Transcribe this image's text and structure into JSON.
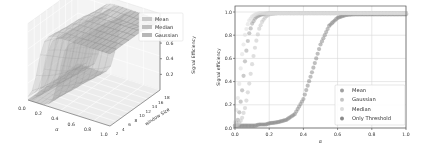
{
  "chart_data": [
    {
      "type": "surface3d",
      "title": "",
      "xlabel": "α",
      "ylabel": "window Size",
      "zlabel": "Signal Efficiency",
      "x_ticks": [
        "0.0",
        "0.2",
        "0.4",
        "0.6",
        "0.8",
        "1.0"
      ],
      "y_ticks": [
        "2",
        "4",
        "6",
        "8",
        "10",
        "12",
        "14",
        "16",
        "18"
      ],
      "z_ticks": [
        "0.2",
        "0.4",
        "0.6",
        "0.8"
      ],
      "xlim": [
        0,
        1
      ],
      "ylim": [
        2,
        18
      ],
      "zlim": [
        0,
        0.9
      ],
      "legend": [
        "Mean",
        "Median",
        "Gaussian"
      ],
      "legend_position": "upper right",
      "grid": true,
      "series": [
        {
          "name": "Mean",
          "color": "#b8b8b8",
          "description": "rises steeply near α≈0.1–0.2, plateau ~0.85"
        },
        {
          "name": "Median",
          "color": "#a8a8a8",
          "description": "rises near α≈0.15–0.3, plateau ~0.85"
        },
        {
          "name": "Gaussian",
          "color": "#989898",
          "description": "rises near α≈0.2–0.5, plateau ~0.85"
        }
      ]
    },
    {
      "type": "scatter",
      "title": "",
      "xlabel": "α",
      "ylabel": "Signal efficiency",
      "xlim": [
        0,
        1
      ],
      "ylim": [
        0,
        1.05
      ],
      "x_ticks": [
        "0.0",
        "0.2",
        "0.4",
        "0.6",
        "0.8",
        "1.0"
      ],
      "y_ticks": [
        "0.0",
        "0.2",
        "0.4",
        "0.6",
        "0.8",
        "1.0"
      ],
      "grid": true,
      "legend_position": "lower right",
      "x": [
        0.0,
        0.02,
        0.04,
        0.06,
        0.08,
        0.1,
        0.12,
        0.14,
        0.16,
        0.18,
        0.2,
        0.25,
        0.3,
        0.35,
        0.4,
        0.45,
        0.5,
        0.55,
        0.6,
        0.65,
        0.7,
        0.8,
        0.9,
        1.0
      ],
      "series": [
        {
          "name": "Mean",
          "color": "#a0a0a0",
          "values": [
            0.02,
            0.08,
            0.3,
            0.6,
            0.8,
            0.9,
            0.95,
            0.97,
            0.98,
            0.985,
            0.99,
            0.99,
            0.99,
            0.99,
            0.99,
            0.99,
            0.99,
            0.99,
            0.99,
            0.99,
            0.99,
            0.99,
            0.99,
            0.99
          ]
        },
        {
          "name": "Gaussian",
          "color": "#c4c4c4",
          "values": [
            0.02,
            0.03,
            0.08,
            0.18,
            0.35,
            0.55,
            0.72,
            0.85,
            0.92,
            0.96,
            0.98,
            0.99,
            0.99,
            0.99,
            0.99,
            0.99,
            0.99,
            0.99,
            0.99,
            0.99,
            0.99,
            0.99,
            0.99,
            0.99
          ]
        },
        {
          "name": "Median",
          "color": "#dcdcdc",
          "values": [
            0.05,
            0.3,
            0.62,
            0.82,
            0.92,
            0.96,
            0.98,
            0.99,
            0.99,
            0.99,
            0.99,
            0.99,
            0.99,
            0.99,
            0.99,
            0.99,
            0.99,
            0.99,
            0.99,
            0.99,
            0.99,
            0.99,
            0.99,
            0.99
          ]
        },
        {
          "name": "Only Threshold",
          "color": "#8a8a8a",
          "values": [
            0.02,
            0.02,
            0.02,
            0.02,
            0.02,
            0.02,
            0.02,
            0.03,
            0.03,
            0.03,
            0.04,
            0.05,
            0.07,
            0.12,
            0.25,
            0.48,
            0.72,
            0.88,
            0.95,
            0.975,
            0.98,
            0.98,
            0.98,
            0.98
          ]
        }
      ],
      "legend": [
        "Mean",
        "Gaussian",
        "Median",
        "Only Threshold"
      ]
    }
  ]
}
